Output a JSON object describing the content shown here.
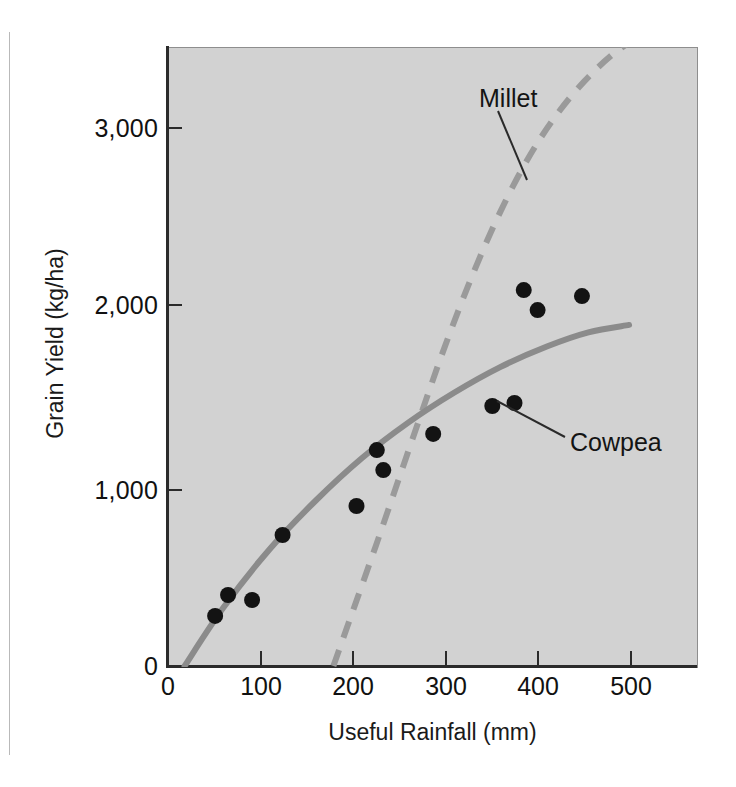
{
  "figure": {
    "background_color": "#ffffff",
    "plot_background_color": "#d2d2d2",
    "axis_color": "#2b2b2b"
  },
  "chart_data": {
    "type": "scatter",
    "title": "",
    "xlabel": "Useful Rainfall (mm)",
    "ylabel": "Grain Yield (kg/ha)",
    "xlim": [
      0,
      575
    ],
    "ylim": [
      0,
      3500
    ],
    "xticks": [
      0,
      100,
      200,
      300,
      400,
      500
    ],
    "xtick_labels": [
      "0",
      "100",
      "200",
      "300",
      "400",
      "500"
    ],
    "yticks": [
      0,
      1000,
      2000,
      3000
    ],
    "ytick_labels": [
      "0",
      "1,000",
      "2,000",
      "3,000"
    ],
    "grid": false,
    "legend": "inline-annotations",
    "series": [
      {
        "name": "Cowpea",
        "label": "Cowpea",
        "style": "solid",
        "color": "#8b8b8b",
        "marker": "filled-circle",
        "marker_color": "#131313",
        "points": [
          {
            "x": 51,
            "y": 283
          },
          {
            "x": 65,
            "y": 401
          },
          {
            "x": 91,
            "y": 373
          },
          {
            "x": 124,
            "y": 740
          },
          {
            "x": 204,
            "y": 904
          },
          {
            "x": 226,
            "y": 1220
          },
          {
            "x": 233,
            "y": 1107
          },
          {
            "x": 287,
            "y": 1311
          },
          {
            "x": 351,
            "y": 1469
          },
          {
            "x": 375,
            "y": 1486
          },
          {
            "x": 385,
            "y": 2124
          },
          {
            "x": 400,
            "y": 2011
          },
          {
            "x": 448,
            "y": 2090
          }
        ],
        "fit_curve": [
          {
            "x": 18,
            "y": 0
          },
          {
            "x": 60,
            "y": 330
          },
          {
            "x": 110,
            "y": 660
          },
          {
            "x": 160,
            "y": 935
          },
          {
            "x": 210,
            "y": 1175
          },
          {
            "x": 260,
            "y": 1375
          },
          {
            "x": 310,
            "y": 1545
          },
          {
            "x": 360,
            "y": 1690
          },
          {
            "x": 410,
            "y": 1805
          },
          {
            "x": 455,
            "y": 1885
          },
          {
            "x": 499,
            "y": 1927
          }
        ]
      },
      {
        "name": "Millet",
        "label": "Millet",
        "style": "dashed",
        "color": "#9a9a9a",
        "marker": "none",
        "points": [],
        "fit_curve": [
          {
            "x": 179,
            "y": 0
          },
          {
            "x": 200,
            "y": 310
          },
          {
            "x": 225,
            "y": 680
          },
          {
            "x": 250,
            "y": 1060
          },
          {
            "x": 275,
            "y": 1440
          },
          {
            "x": 300,
            "y": 1810
          },
          {
            "x": 330,
            "y": 2215
          },
          {
            "x": 360,
            "y": 2570
          },
          {
            "x": 390,
            "y": 2870
          },
          {
            "x": 420,
            "y": 3110
          },
          {
            "x": 450,
            "y": 3300
          },
          {
            "x": 480,
            "y": 3450
          },
          {
            "x": 510,
            "y": 3560
          }
        ]
      }
    ],
    "annotations": [
      {
        "text": "Millet",
        "target_series": "Millet"
      },
      {
        "text": "Cowpea",
        "target_series": "Cowpea"
      }
    ]
  }
}
